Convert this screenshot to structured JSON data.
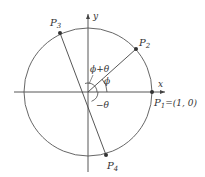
{
  "diagram": {
    "type": "unit-circle-rotation",
    "axes": {
      "x_label": "x",
      "y_label": "y"
    },
    "points": [
      {
        "name": "P1",
        "label_main": "P",
        "label_sub": "1",
        "coords_text": "=(1, 0)"
      },
      {
        "name": "P2",
        "label_main": "P",
        "label_sub": "2"
      },
      {
        "name": "P3",
        "label_main": "P",
        "label_sub": "3"
      },
      {
        "name": "P4",
        "label_main": "P",
        "label_sub": "4"
      }
    ],
    "angles": [
      {
        "name": "phi",
        "label": "ϕ"
      },
      {
        "name": "phi-plus-theta",
        "label": "ϕ+θ"
      },
      {
        "name": "minus-theta",
        "label": "−θ"
      }
    ],
    "colors": {
      "stroke": "#444444",
      "point": "#333333",
      "background": "#ffffff"
    }
  }
}
